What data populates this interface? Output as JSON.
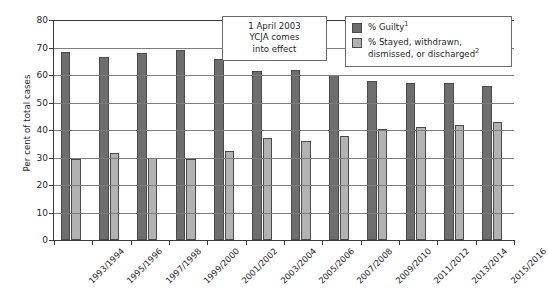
{
  "chart_data": {
    "type": "bar",
    "title": "",
    "xlabel": "",
    "ylabel": "Per cent of total cases",
    "ylim": [
      0,
      80
    ],
    "yticks": [
      0,
      10,
      20,
      30,
      40,
      50,
      60,
      70,
      80
    ],
    "grid": true,
    "legend_position": "top-right",
    "categories": [
      "1993/1994",
      "1995/1996",
      "1997/1998",
      "1999/2000",
      "2001/2002",
      "2003/2004",
      "2005/2006",
      "2007/2008",
      "2009/2010",
      "2011/2012",
      "2013/2014",
      "2015/2016"
    ],
    "series": [
      {
        "name": "% Guilty",
        "footnote": "1",
        "color": "#6e6e6e",
        "values": [
          68.5,
          66.5,
          68,
          69,
          66,
          61.5,
          62,
          60,
          58,
          57,
          57,
          56
        ]
      },
      {
        "name": "% Stayed, withdrawn, dismissed, or discharged",
        "footnote": "2",
        "color": "#b2b2b2",
        "values": [
          29.5,
          31.5,
          30,
          29.5,
          32.5,
          37,
          36,
          38,
          40.5,
          41,
          42,
          43
        ]
      }
    ],
    "annotations": [
      {
        "name": "ycja-callout",
        "lines": [
          "1 April 2003",
          "YCJA comes",
          "into effect"
        ]
      }
    ]
  },
  "legend": {
    "items": [
      {
        "label": "% Guilty",
        "footnote": "1"
      },
      {
        "label": "% Stayed, withdrawn,",
        "label2": "dismissed, or discharged",
        "footnote": "2"
      }
    ]
  },
  "annotation": {
    "line1": "1 April 2003",
    "line2": "YCJA comes",
    "line3": "into effect"
  },
  "axis": {
    "y_title": "Per cent of total cases"
  }
}
